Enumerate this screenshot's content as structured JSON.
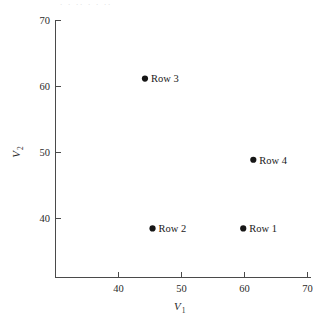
{
  "figure": {
    "title_remnant": "·  · ··   ·      · ··",
    "background_color": "#ffffff",
    "axis_color": "#4a4a4a",
    "marker_color": "#161616"
  },
  "chart_data": {
    "type": "scatter",
    "title": "",
    "xlabel": "V",
    "xlabel_sub": "1",
    "ylabel": "V",
    "ylabel_sub": "2",
    "xlim": [
      33,
      70
    ],
    "ylim": [
      34,
      70
    ],
    "xticks": [
      40,
      50,
      60,
      70
    ],
    "yticks": [
      40,
      50,
      60,
      70
    ],
    "xticklabels": [
      "40",
      "50",
      "60",
      "70"
    ],
    "yticklabels": [
      "40",
      "50",
      "60",
      "70"
    ],
    "grid": false,
    "legend": "none",
    "points": [
      {
        "label": "Row 1",
        "x": 59.8,
        "y": 38.5
      },
      {
        "label": "Row 2",
        "x": 45.4,
        "y": 38.5
      },
      {
        "label": "Row 3",
        "x": 44.2,
        "y": 61.2
      },
      {
        "label": "Row 4",
        "x": 61.4,
        "y": 48.9
      }
    ]
  }
}
